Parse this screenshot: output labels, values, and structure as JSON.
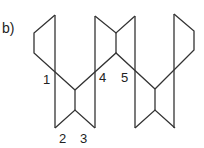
{
  "figure": {
    "part_label": "b)",
    "stroke_color": "#333333",
    "labels": [
      {
        "text": "1",
        "x": 43,
        "y": 84
      },
      {
        "text": "2",
        "x": 63,
        "y": 143
      },
      {
        "text": "3",
        "x": 84,
        "y": 143
      },
      {
        "text": "4",
        "x": 103,
        "y": 82
      },
      {
        "text": "5",
        "x": 125,
        "y": 82
      }
    ]
  }
}
